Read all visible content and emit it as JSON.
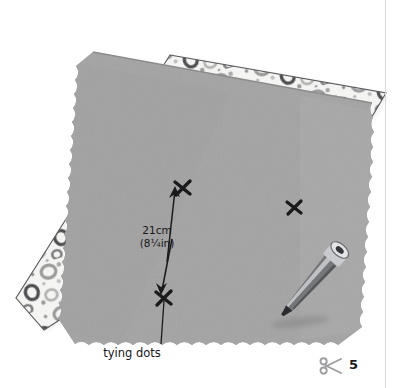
{
  "page": {
    "number": "5",
    "icon": "scissors-icon",
    "background_color": "#ffffff",
    "margin_rule_color": "#d8d8d8"
  },
  "illustration": {
    "title": "Two layers of fabric with tying dots marked",
    "layers": [
      {
        "name": "patterned-backing-fabric",
        "description": "white fabric printed with grey rings and dots, placed underneath and offset up-left",
        "base_color": "#f4f4f2",
        "ring_color": "#8f8f8f",
        "dark_ring_color": "#555558",
        "outline_color": "#4a4a4d"
      },
      {
        "name": "grey-top-fabric",
        "description": "plain grey fabric square with pinked scalloped edges, lying on top",
        "base_color": "#a8a8a8",
        "shade_color": "#9a9a9a",
        "edge_color": "#8e8e8e"
      }
    ],
    "tool": {
      "name": "fabric-marker-pen",
      "description": "tailor's marking pen lying diagonally on the grey fabric with a cast shadow",
      "body_color": "#6f7074",
      "highlight_color": "#e8e8ea",
      "cap_color": "#c9c9cc",
      "shadow_color": "#8e8e8e"
    },
    "marks": [
      {
        "name": "tying-dot-top",
        "x": 182,
        "y": 188,
        "color": "#1a1a1c"
      },
      {
        "name": "tying-dot-bottom",
        "x": 163,
        "y": 298,
        "color": "#1a1a1c"
      },
      {
        "name": "tying-dot-right",
        "x": 294,
        "y": 207,
        "color": "#1a1a1c"
      }
    ],
    "annotations": {
      "measurement": {
        "name": "spacing-measurement",
        "value_metric": "21cm",
        "value_imperial": "(8¼in)",
        "arrow_style": "double-headed-vertical",
        "from": {
          "x": 163,
          "y": 292
        },
        "to": {
          "x": 174,
          "y": 186
        }
      },
      "callout": {
        "name": "tying-dots-callout",
        "label": "tying dots",
        "leader_from": {
          "x": 161,
          "y": 346
        },
        "leader_to": {
          "x": 164,
          "y": 300
        }
      }
    }
  }
}
